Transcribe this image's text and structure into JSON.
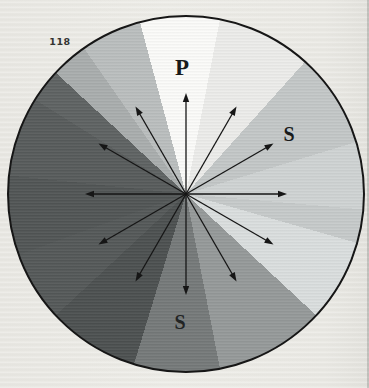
{
  "figure": {
    "number": "118",
    "label_p": "P",
    "label_s_right": "S",
    "label_s_bottom": "S"
  },
  "colors": {
    "paper": "#eae9e4",
    "outline": "#161616",
    "arrow": "#161616",
    "label_text": "#181a1a"
  },
  "wheel": {
    "cx": 186,
    "cy": 194,
    "r": 179,
    "gradient_from_deg": -15,
    "sectors": [
      {
        "start": 0,
        "end": 26,
        "color": "#fbfbf9"
      },
      {
        "start": 26,
        "end": 57,
        "color": "#ececea"
      },
      {
        "start": 57,
        "end": 88,
        "color": "#c3c7c7"
      },
      {
        "start": 88,
        "end": 110,
        "color": "#cfd3d3"
      },
      {
        "start": 110,
        "end": 121,
        "color": "#c6caca"
      },
      {
        "start": 121,
        "end": 148,
        "color": "#dadede"
      },
      {
        "start": 148,
        "end": 184,
        "color": "#959999"
      },
      {
        "start": 184,
        "end": 212,
        "color": "#757979"
      },
      {
        "start": 212,
        "end": 242,
        "color": "#4c5050"
      },
      {
        "start": 242,
        "end": 265,
        "color": "#545858"
      },
      {
        "start": 265,
        "end": 291,
        "color": "#515555"
      },
      {
        "start": 291,
        "end": 317,
        "color": "#575b5b"
      },
      {
        "start": 317,
        "end": 328,
        "color": "#5e6262"
      },
      {
        "start": 328,
        "end": 340,
        "color": "#a9adad"
      },
      {
        "start": 340,
        "end": 360,
        "color": "#babebe"
      }
    ]
  },
  "arrows": {
    "count": 12,
    "step_deg": 30,
    "start_deg": 0,
    "length": 101,
    "head_length": 9,
    "head_half_width": 3.2,
    "stroke_width": 1.3
  }
}
